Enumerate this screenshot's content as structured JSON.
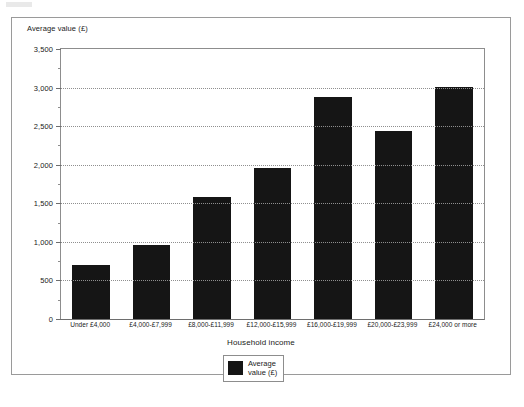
{
  "chart_data": {
    "type": "bar",
    "title": "",
    "subtitle": "",
    "xlabel": "Household income",
    "ylabel": "Average value (£)",
    "categories": [
      "Under £4,000",
      "£4,000-£7,999",
      "£8,000-£11,999",
      "£12,000-£15,999",
      "£16,000-£19,999",
      "£20,000-£23,999",
      "£24,000 or more"
    ],
    "values": [
      700,
      960,
      1580,
      1960,
      2880,
      2440,
      3010
    ],
    "series": [
      {
        "name": "Average value (£)",
        "values": [
          700,
          960,
          1580,
          1960,
          2880,
          2440,
          3010
        ],
        "color": "#151515"
      }
    ],
    "ylim": [
      0,
      3500
    ],
    "ytick_values": [
      0,
      500,
      1000,
      1500,
      2000,
      2500,
      3000,
      3500
    ],
    "ytick_labels": [
      "0",
      "500",
      "1,000",
      "1,500",
      "2,000",
      "2,500",
      "3,000",
      "3,500"
    ],
    "yminor_step": 250,
    "grid": "horizontal-dotted",
    "legend": {
      "position": "bottom-center",
      "entries": [
        {
          "label_line1": "Average",
          "label_line2": "value (£)",
          "color": "#151515"
        }
      ]
    },
    "bar_color": "#151515",
    "background_color": "#ffffff",
    "frame_color": "#9a9a9a"
  }
}
